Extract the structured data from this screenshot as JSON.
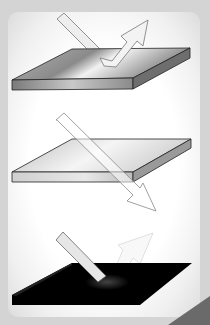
{
  "diagram": {
    "type": "light-surface-interaction",
    "panels": [
      {
        "id": "reflection",
        "surface": "mirror / shiny metal plate",
        "arrow": "incident arrow bounces off (reflected)"
      },
      {
        "id": "transmission",
        "surface": "transparent plate",
        "arrow": "incident arrow passes through (transmitted)"
      },
      {
        "id": "absorption",
        "surface": "black plate",
        "arrow": "incident arrow mostly absorbed, faint reflection"
      }
    ]
  },
  "colors": {
    "background": "#d4d4d4",
    "panel": "#ffffff",
    "plate_metal": "#9a9a9a",
    "plate_black": "#000000",
    "arrow_fill": "#eeeeee",
    "outline": "#222222"
  }
}
